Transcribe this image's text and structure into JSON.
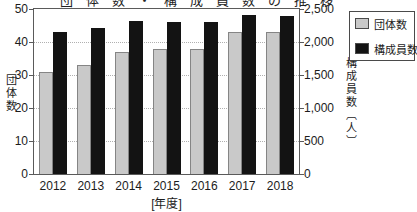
{
  "header": {
    "clipped_title": "団体数・構成員数の推移"
  },
  "chart_data": {
    "type": "bar",
    "categories": [
      "2012",
      "2013",
      "2014",
      "2015",
      "2016",
      "2017",
      "2018"
    ],
    "series": [
      {
        "key": "groups",
        "name": "団体数",
        "axis": "left",
        "color": "#c9c9c9",
        "values": [
          31,
          33,
          37,
          38,
          38,
          43,
          43
        ]
      },
      {
        "key": "members",
        "name": "構成員数",
        "axis": "right",
        "color": "#131313",
        "values": [
          2150,
          2210,
          2320,
          2310,
          2310,
          2410,
          2400
        ]
      }
    ],
    "left_axis": {
      "label": "団体数",
      "min": 0,
      "max": 50,
      "tick_values": [
        50,
        40,
        30,
        20,
        10,
        0
      ],
      "tick_labels": [
        "50",
        "40",
        "30",
        "20",
        "10",
        "0"
      ]
    },
    "right_axis": {
      "label": "構成員数〔人〕",
      "min": 0,
      "max": 2500,
      "tick_labels": [
        "2,500",
        "2,000",
        "1,500",
        "1,000",
        "500",
        "0"
      ]
    },
    "xlabel": "[年度]",
    "grid": true,
    "legend": {
      "position": "top-right",
      "items": [
        {
          "label": "団体数",
          "color": "#c9c9c9"
        },
        {
          "label": "構成員数",
          "color": "#131313"
        }
      ]
    }
  }
}
